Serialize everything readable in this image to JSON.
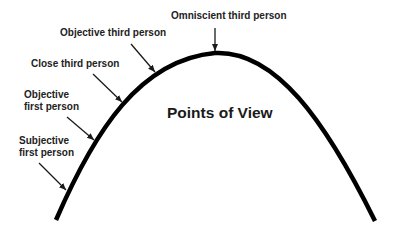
{
  "diagram": {
    "title": "Points of View",
    "colors": {
      "curve": "#000000",
      "arrow": "#1a1a1a",
      "text": "#222222",
      "background": "#ffffff"
    },
    "curve": {
      "shape": "arch",
      "start": [
        56,
        220
      ],
      "apex": [
        215,
        53
      ],
      "end": [
        375,
        221
      ]
    },
    "labels": [
      {
        "id": "omniscient-third",
        "line1": "Omniscient third person",
        "line2": ""
      },
      {
        "id": "objective-third",
        "line1": "Objective third person",
        "line2": ""
      },
      {
        "id": "close-third",
        "line1": "Close third person",
        "line2": ""
      },
      {
        "id": "objective-first",
        "line1": "Objective",
        "line2": "first person"
      },
      {
        "id": "subjective-first",
        "line1": "Subjective",
        "line2": "first person"
      }
    ],
    "arrows": [
      {
        "target": "omniscient-third",
        "from": [
          215,
          28
        ],
        "to": [
          215,
          52
        ]
      },
      {
        "target": "objective-third",
        "from": [
          131,
          44
        ],
        "to": [
          156,
          73
        ]
      },
      {
        "target": "close-third",
        "from": [
          93,
          74
        ],
        "to": [
          123,
          103
        ]
      },
      {
        "target": "objective-first",
        "from": [
          67,
          117
        ],
        "to": [
          95,
          141
        ]
      },
      {
        "target": "subjective-first",
        "from": [
          39,
          163
        ],
        "to": [
          67,
          191
        ]
      }
    ]
  }
}
